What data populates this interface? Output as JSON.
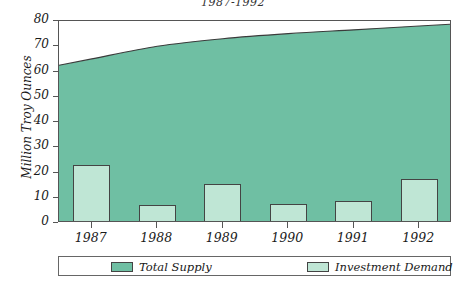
{
  "chart_data": {
    "type": "area",
    "title": "1987-1992",
    "xlabel": "",
    "ylabel": "Million Troy Ounces",
    "categories": [
      "1987",
      "1988",
      "1989",
      "1990",
      "1991",
      "1992"
    ],
    "ylim": [
      0,
      80
    ],
    "yticks": [
      0,
      10,
      20,
      30,
      40,
      50,
      60,
      70,
      80
    ],
    "ytick_labels": [
      "0",
      "10",
      "20",
      "30",
      "40",
      "50",
      "60",
      "70",
      "80"
    ],
    "grid": false,
    "legend_position": "bottom",
    "series": [
      {
        "name": "Total Supply",
        "type": "area",
        "color": "#6FBFA3",
        "values": [
          65,
          70,
          73,
          75,
          76.5,
          78
        ]
      },
      {
        "name": "Investment Demand",
        "type": "bar",
        "color": "#BFE6D5",
        "values": [
          23,
          7,
          15.5,
          7.5,
          8.7,
          17.5
        ]
      }
    ]
  },
  "legend": {
    "items": [
      {
        "label": "Total Supply",
        "color": "#6FBFA3"
      },
      {
        "label": "Investment Demand",
        "color": "#BFE6D5"
      }
    ]
  }
}
